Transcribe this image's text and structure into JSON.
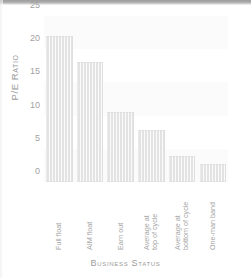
{
  "chart_data": {
    "type": "bar",
    "title": "",
    "xlabel": "Business Status",
    "ylabel": "P/E Ratio",
    "categories": [
      "Full float",
      "AIM float",
      "Earn out",
      "Average at\ntop of cycle",
      "Average at\nbottom of cycle",
      "One-man band"
    ],
    "values": [
      22.0,
      18.0,
      10.6,
      7.8,
      3.9,
      2.7
    ],
    "ylim": [
      0,
      25
    ],
    "yticks": [
      0,
      5,
      10,
      15,
      20,
      25
    ],
    "ytick_labels": [
      "0",
      "5",
      "10",
      "15",
      "20",
      "25"
    ],
    "grid": false,
    "legend": "none",
    "bar_color": "#e3e3e3",
    "text_color": "#a2a2a2"
  },
  "axes": {
    "y_title": "P/E Ratio",
    "x_title": "Business Status"
  }
}
